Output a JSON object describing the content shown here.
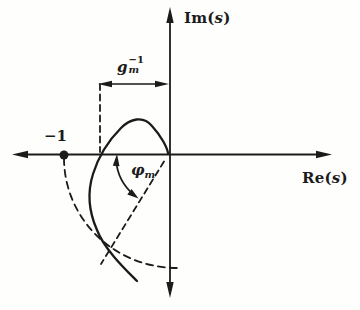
{
  "figure": {
    "background": "#fefefd",
    "ink": "#1b1b1b"
  },
  "axes": {
    "imaginary_label": {
      "name": "Im",
      "open": "(",
      "var": "s",
      "close": ")"
    },
    "real_label": {
      "name": "Re",
      "open": "(",
      "var": "s",
      "close": ")"
    }
  },
  "points": {
    "minus_one": "−1"
  },
  "annotations": {
    "gain_margin": {
      "base": "g",
      "sub": "m",
      "sup": "−1"
    },
    "phase_margin": {
      "base": "φ",
      "sub": "m"
    }
  }
}
